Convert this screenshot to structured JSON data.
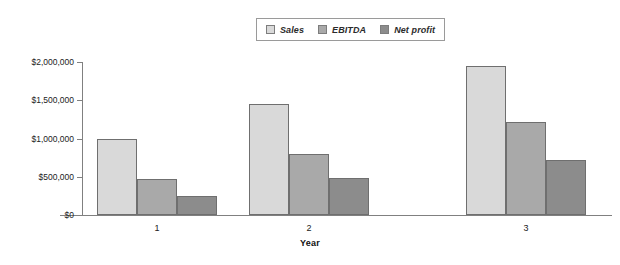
{
  "chart_data": {
    "type": "bar",
    "title": "",
    "xlabel": "Year",
    "ylabel": "",
    "categories": [
      "1",
      "2",
      "3"
    ],
    "series": [
      {
        "name": "Sales",
        "color": "#d9d9d9",
        "values": [
          1000000,
          1450000,
          1950000
        ]
      },
      {
        "name": "EBITDA",
        "color": "#a9a9a9",
        "values": [
          470000,
          800000,
          1210000
        ]
      },
      {
        "name": "Net profit",
        "color": "#8c8c8c",
        "values": [
          250000,
          480000,
          720000
        ]
      }
    ],
    "ylim": [
      0,
      2000000
    ],
    "yticks": [
      0,
      500000,
      1000000,
      1500000,
      2000000
    ],
    "ytick_labels": [
      "$0",
      "$500,000",
      "$1,000,000",
      "$1,500,000",
      "$2,000,000"
    ],
    "grid": false,
    "legend_position": "top-center",
    "legend_entries": [
      "Sales",
      "EBITDA",
      "Net profit"
    ]
  },
  "axis": {
    "x_title": "Year"
  }
}
